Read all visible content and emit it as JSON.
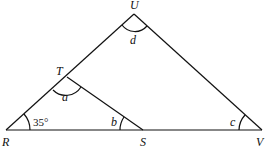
{
  "diagram": {
    "points": {
      "R": {
        "label": "R",
        "x": 6,
        "y": 130
      },
      "S": {
        "label": "S",
        "x": 143,
        "y": 130
      },
      "V": {
        "label": "V",
        "x": 262,
        "y": 130
      },
      "U": {
        "label": "U",
        "x": 134,
        "y": 14
      },
      "T": {
        "label": "T",
        "x": 67,
        "y": 77
      }
    },
    "segments": [
      "R-V",
      "R-U",
      "U-V",
      "T-S"
    ],
    "angles": {
      "R": "35°",
      "T": "a",
      "S": "b",
      "V": "c",
      "U": "d"
    }
  }
}
